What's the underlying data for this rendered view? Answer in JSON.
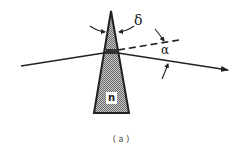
{
  "figure": {
    "caption": "(a)",
    "labels": {
      "deviation_angle": "δ",
      "wedge_angle": "α",
      "refractive_index": "n"
    },
    "elements": [
      {
        "name": "prism",
        "shape": "thin wedge / narrow triangle",
        "fill": "hatched gray"
      },
      {
        "name": "incident-ray",
        "style": "solid"
      },
      {
        "name": "undeviated-ray-extension",
        "style": "dashed"
      },
      {
        "name": "refracted-ray",
        "style": "solid with arrowhead"
      }
    ],
    "colors": {
      "line": "#222222",
      "prism_fill": "#9a9a9a",
      "background": "#ffffff"
    }
  }
}
